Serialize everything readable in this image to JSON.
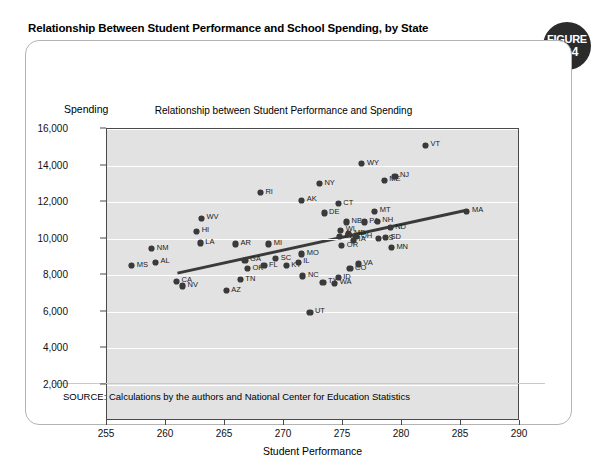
{
  "figure": {
    "title": "Relationship Between Student Performance and School Spending, by State",
    "badge_word": "FIGURE",
    "badge_number": "15.4",
    "source": "SOURCE: Calculations by the authors and National Center for Education Statistics"
  },
  "chart_data": {
    "type": "scatter",
    "title": "Relationship between Student Performance and Spending",
    "xlabel": "Student Performance",
    "ylabel": "Spending",
    "xlim": [
      255,
      290
    ],
    "ylim": [
      0,
      16000
    ],
    "xticks": [
      "255",
      "260",
      "265",
      "270",
      "275",
      "280",
      "285",
      "290"
    ],
    "yticks": [
      "16,000",
      "14,000",
      "12,000",
      "10,000",
      "8,000",
      "6,000",
      "4,000",
      "2,000"
    ],
    "grid": "horizontal",
    "legend": "none",
    "trendline": {
      "label": "linear fit",
      "x_start": 261.0,
      "y_start": 8050,
      "x_end": 285.6,
      "y_end": 11520
    },
    "points": [
      {
        "label": "MS",
        "x": 257.1,
        "y": 8500
      },
      {
        "label": "AL",
        "x": 259.1,
        "y": 8700
      },
      {
        "label": "NM",
        "x": 258.8,
        "y": 9450
      },
      {
        "label": "HI",
        "x": 262.6,
        "y": 10400
      },
      {
        "label": "WV",
        "x": 263.0,
        "y": 11100
      },
      {
        "label": "LA",
        "x": 262.9,
        "y": 9750
      },
      {
        "label": "CA",
        "x": 260.9,
        "y": 7650
      },
      {
        "label": "NV",
        "x": 261.4,
        "y": 7400
      },
      {
        "label": "AZ",
        "x": 265.1,
        "y": 7150
      },
      {
        "label": "TN",
        "x": 266.3,
        "y": 7750
      },
      {
        "label": "AR",
        "x": 265.9,
        "y": 9700
      },
      {
        "label": "GA",
        "x": 266.7,
        "y": 8800
      },
      {
        "label": "OK",
        "x": 266.9,
        "y": 8350
      },
      {
        "label": "FL",
        "x": 268.3,
        "y": 8500
      },
      {
        "label": "RI",
        "x": 268.0,
        "y": 12500
      },
      {
        "label": "MI",
        "x": 268.7,
        "y": 9700
      },
      {
        "label": "SC",
        "x": 269.3,
        "y": 8900
      },
      {
        "label": "KY",
        "x": 270.2,
        "y": 8500
      },
      {
        "label": "IL",
        "x": 271.2,
        "y": 8700
      },
      {
        "label": "MO",
        "x": 271.5,
        "y": 9150
      },
      {
        "label": "AK",
        "x": 271.5,
        "y": 12100
      },
      {
        "label": "NC",
        "x": 271.6,
        "y": 7950
      },
      {
        "label": "UT",
        "x": 272.2,
        "y": 5950
      },
      {
        "label": "NY",
        "x": 273.0,
        "y": 13000
      },
      {
        "label": "DE",
        "x": 273.4,
        "y": 11400
      },
      {
        "label": "TX",
        "x": 273.3,
        "y": 7600
      },
      {
        "label": "WA",
        "x": 274.3,
        "y": 7550
      },
      {
        "label": "ID",
        "x": 274.6,
        "y": 7850
      },
      {
        "label": "CT",
        "x": 274.6,
        "y": 11900
      },
      {
        "label": "WI",
        "x": 274.8,
        "y": 10450
      },
      {
        "label": "IN",
        "x": 274.7,
        "y": 10100
      },
      {
        "label": "MD",
        "x": 275.5,
        "y": 10250
      },
      {
        "label": "OR",
        "x": 274.9,
        "y": 9600
      },
      {
        "label": "NB",
        "x": 275.3,
        "y": 10900
      },
      {
        "label": "OH",
        "x": 276.1,
        "y": 10100
      },
      {
        "label": "IA",
        "x": 275.9,
        "y": 9900
      },
      {
        "label": "CO",
        "x": 275.6,
        "y": 8350
      },
      {
        "label": "VA",
        "x": 276.3,
        "y": 8600
      },
      {
        "label": "WY",
        "x": 276.6,
        "y": 14100
      },
      {
        "label": "PA",
        "x": 276.8,
        "y": 10900
      },
      {
        "label": "MT",
        "x": 277.7,
        "y": 11500
      },
      {
        "label": "NH",
        "x": 277.9,
        "y": 10950
      },
      {
        "label": "KS",
        "x": 278.0,
        "y": 10000
      },
      {
        "label": "SD",
        "x": 278.6,
        "y": 10050
      },
      {
        "label": "ME",
        "x": 278.5,
        "y": 13200
      },
      {
        "label": "NJ",
        "x": 279.4,
        "y": 13400
      },
      {
        "label": "ND",
        "x": 279.0,
        "y": 10600
      },
      {
        "label": "MN",
        "x": 279.1,
        "y": 9500
      },
      {
        "label": "VT",
        "x": 282.0,
        "y": 15100
      },
      {
        "label": "MA",
        "x": 285.5,
        "y": 11500
      }
    ]
  }
}
